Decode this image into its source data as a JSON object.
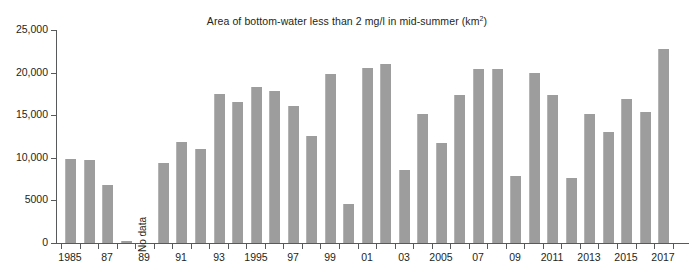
{
  "chart_data": {
    "type": "bar",
    "title": "Area of bottom-water less than 2 mg/l in mid-summer (km2)",
    "title_main": "Area of bottom-water less than 2 mg/l in mid-summer (km",
    "title_sup": "2",
    "title_tail": ")",
    "xlabel": "",
    "ylabel": "",
    "ylim": [
      0,
      25000
    ],
    "grid": false,
    "legend": "none",
    "bar_color": "#9d9d9d",
    "axis_color": "#58595b",
    "text_color": "#231f20",
    "y_ticks": [
      {
        "value": 25000,
        "label": "25,000"
      },
      {
        "value": 20000,
        "label": "20,000"
      },
      {
        "value": 15000,
        "label": "15,000"
      },
      {
        "value": 10000,
        "label": "10,000"
      },
      {
        "value": 5000,
        "label": "5000"
      },
      {
        "value": 0,
        "label": "0"
      }
    ],
    "x_tick_labels": [
      {
        "year": 1985,
        "label": "1985"
      },
      {
        "year": 1987,
        "label": "87"
      },
      {
        "year": 1989,
        "label": "89"
      },
      {
        "year": 1991,
        "label": "91"
      },
      {
        "year": 1993,
        "label": "93"
      },
      {
        "year": 1995,
        "label": "1995"
      },
      {
        "year": 1997,
        "label": "97"
      },
      {
        "year": 1999,
        "label": "99"
      },
      {
        "year": 2001,
        "label": "01"
      },
      {
        "year": 2003,
        "label": "03"
      },
      {
        "year": 2005,
        "label": "2005"
      },
      {
        "year": 2007,
        "label": "07"
      },
      {
        "year": 2009,
        "label": "09"
      },
      {
        "year": 2011,
        "label": "2011"
      },
      {
        "year": 2013,
        "label": "2013"
      },
      {
        "year": 2015,
        "label": "2015"
      },
      {
        "year": 2017,
        "label": "2017"
      }
    ],
    "categories": [
      "1985",
      "1986",
      "1987",
      "1988",
      "1989",
      "1990",
      "1991",
      "1992",
      "1993",
      "1994",
      "1995",
      "1996",
      "1997",
      "1998",
      "1999",
      "2000",
      "2001",
      "2002",
      "2003",
      "2004",
      "2005",
      "2006",
      "2007",
      "2008",
      "2009",
      "2010",
      "2011",
      "2012",
      "2013",
      "2014",
      "2015",
      "2016",
      "2017"
    ],
    "values": [
      9900,
      9700,
      6800,
      200,
      null,
      9400,
      11900,
      11000,
      17500,
      16600,
      18300,
      17900,
      16100,
      12600,
      19800,
      4600,
      20600,
      21000,
      8600,
      15100,
      11700,
      17400,
      20400,
      20400,
      7900,
      20000,
      17400,
      7600,
      15200,
      13000,
      16900,
      15400,
      22800
    ],
    "annotations": [
      {
        "name": "no-data",
        "text": "No data",
        "year": 1989,
        "rotation": -90
      }
    ]
  }
}
